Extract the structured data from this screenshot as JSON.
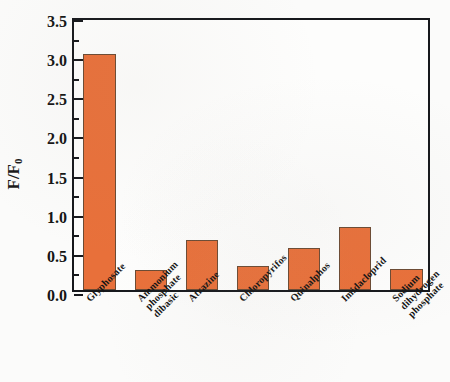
{
  "chart_data": {
    "type": "bar",
    "title": "",
    "xlabel": "",
    "ylabel": "F/F0",
    "ylabel_main": "F/F",
    "ylabel_sub": "0",
    "ylim": [
      0,
      3.5
    ],
    "ytick_labels": [
      "0.0",
      "0.5",
      "1.0",
      "1.5",
      "2.0",
      "2.5",
      "3.0",
      "3.5"
    ],
    "ytick_values": [
      0.0,
      0.5,
      1.0,
      1.5,
      2.0,
      2.5,
      3.0,
      3.5
    ],
    "minor_ticks": true,
    "grid": false,
    "legend": "none",
    "bar_color": "#e8703a",
    "bar_edge_color": "#6b4a33",
    "axis_color": "#16181c",
    "categories": [
      "Glyphosate",
      "Ammonium\nphosphate\ndibasic",
      "Atrazine",
      "Chloropyrifos",
      "Quinalphos",
      "Imidacloprid",
      "Sodium\ndihydrogen\nphosphate"
    ],
    "values": [
      3.02,
      0.26,
      0.64,
      0.31,
      0.54,
      0.8,
      0.27
    ]
  }
}
